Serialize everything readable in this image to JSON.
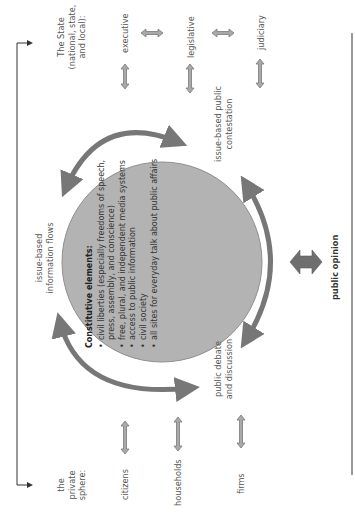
{
  "diagram": {
    "orientation": "rotated -90deg (text reads bottom to top)",
    "colors": {
      "circle_fill": "#b3b3b3",
      "circle_stroke": "#8a8a8a",
      "arc_arrows": "#777777",
      "double_arrows_fill": "#a9a9a9",
      "double_arrows_stroke": "#7a7a7a",
      "public_opinion_arrow": "#6e6e6e",
      "frame_line": "#333333",
      "text": "#555555"
    },
    "state": {
      "heading_line1": "The State",
      "heading_line2": "(national, state,",
      "heading_line3": "and local):",
      "members": [
        "executive",
        "legislative",
        "judiciary"
      ]
    },
    "private_sphere": {
      "heading_line1": "the",
      "heading_line2": "private",
      "heading_line3": "sphere:",
      "members": [
        "citizens",
        "households",
        "firms"
      ]
    },
    "flows": {
      "left_line1": "issue-based",
      "left_line2": "information flows",
      "top_right_line1": "issue-based public",
      "top_right_line2": "contestation",
      "bottom_right_line1": "public debate",
      "bottom_right_line2": "and discussion"
    },
    "center": {
      "title": "Constitutive elements:",
      "items": [
        "civil liberties (especially freedoms of speech, press, assembly, and conscience)",
        "free, plural, and independent media systems",
        "access to public information",
        "civil society",
        "all sites for everyday talk about public affairs"
      ]
    },
    "public_opinion": {
      "label": "public opinion"
    }
  }
}
